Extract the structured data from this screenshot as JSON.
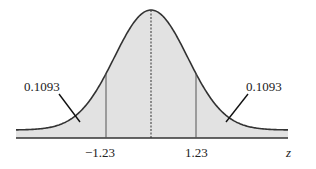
{
  "diagram": {
    "type": "normal_distribution_curve",
    "axis_variable": "z",
    "tick_labels": [
      "−1.23",
      "1.23"
    ],
    "tail_labels": {
      "left": "0.1093",
      "right": "0.1093"
    },
    "center_marker": "dashed-mean-line"
  },
  "chart_data": {
    "type": "area",
    "title": "",
    "xlabel": "z",
    "ylabel": "",
    "critical_values": [
      -1.23,
      1.23
    ],
    "tail_areas": {
      "left": 0.1093,
      "right": 0.1093
    },
    "center": 0,
    "grid": false,
    "legend": "none"
  },
  "colors": {
    "fill": "#e2e2e2",
    "curve": "#333333",
    "axis": "#333333",
    "text": "#222222"
  }
}
